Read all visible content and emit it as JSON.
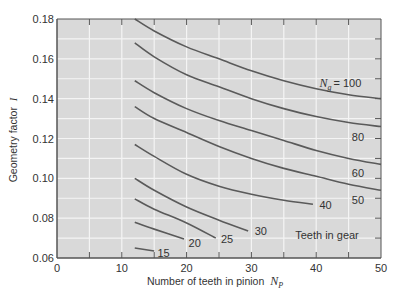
{
  "chart_data": {
    "type": "line",
    "title": "",
    "xlabel": "Number of teeth in pinion",
    "xlabel_sym": "N",
    "xlabel_sub": "P",
    "ylabel": "Geometry factor",
    "ylabel_sym": "I",
    "xlim": [
      0,
      50
    ],
    "ylim": [
      0.06,
      0.18
    ],
    "xticks": [
      0,
      10,
      20,
      30,
      40,
      50
    ],
    "xtick_labels": [
      "0",
      "10",
      "20",
      "30",
      "40",
      "50"
    ],
    "yticks": [
      0.06,
      0.08,
      0.1,
      0.12,
      0.14,
      0.16,
      0.18
    ],
    "ytick_labels": [
      "0.06",
      "0.08",
      "0.10",
      "0.12",
      "0.14",
      "0.16",
      "0.18"
    ],
    "grid": true,
    "grid_x_step": 5,
    "grid_y_step": 0.01,
    "legend_position": "none",
    "annotation": "Teeth in gear",
    "series_label_prefix": "N",
    "series_label_sub": "g",
    "series": [
      {
        "name": "100",
        "label": "= 100",
        "x": [
          12,
          15,
          20,
          25,
          30,
          35,
          40,
          45,
          50
        ],
        "y": [
          0.18,
          0.174,
          0.166,
          0.16,
          0.154,
          0.149,
          0.145,
          0.142,
          0.14
        ],
        "label_pos": [
          40.5,
          0.146
        ]
      },
      {
        "name": "80",
        "x": [
          12,
          15,
          20,
          25,
          30,
          35,
          40,
          45,
          50
        ],
        "y": [
          0.168,
          0.161,
          0.152,
          0.146,
          0.14,
          0.135,
          0.131,
          0.128,
          0.126
        ],
        "label_pos": [
          45.5,
          0.1185
        ]
      },
      {
        "name": "60",
        "x": [
          12,
          15,
          20,
          25,
          30,
          35,
          40,
          45,
          50
        ],
        "y": [
          0.149,
          0.143,
          0.135,
          0.129,
          0.124,
          0.119,
          0.114,
          0.11,
          0.107
        ],
        "label_pos": [
          45.5,
          0.1005
        ]
      },
      {
        "name": "50",
        "x": [
          12,
          15,
          20,
          25,
          30,
          35,
          40,
          45,
          50
        ],
        "y": [
          0.136,
          0.13,
          0.123,
          0.116,
          0.11,
          0.105,
          0.101,
          0.097,
          0.094
        ],
        "label_pos": [
          45.5,
          0.087
        ]
      },
      {
        "name": "40",
        "x": [
          12,
          15,
          20,
          25,
          30,
          35,
          39.5
        ],
        "y": [
          0.117,
          0.111,
          0.102,
          0.096,
          0.092,
          0.089,
          0.087
        ],
        "label_pos": [
          40.5,
          0.0845
        ]
      },
      {
        "name": "30",
        "x": [
          12,
          15,
          20,
          25,
          29.5
        ],
        "y": [
          0.1,
          0.094,
          0.0856,
          0.079,
          0.0736
        ],
        "label_pos": [
          30.5,
          0.0715
        ]
      },
      {
        "name": "25",
        "x": [
          12,
          15,
          20,
          24.5
        ],
        "y": [
          0.0897,
          0.0845,
          0.0776,
          0.07
        ],
        "label_pos": [
          25.3,
          0.0675
        ]
      },
      {
        "name": "20",
        "x": [
          12,
          15,
          19.6
        ],
        "y": [
          0.078,
          0.0745,
          0.0695
        ],
        "label_pos": [
          20.3,
          0.0655
        ]
      },
      {
        "name": "15",
        "x": [
          12,
          15
        ],
        "y": [
          0.065,
          0.0635
        ],
        "label_pos": [
          15.5,
          0.0605
        ]
      }
    ],
    "colors": {
      "plot_bg": "#d9d9d9",
      "grid": "#f4f4f4",
      "axis": "#555555",
      "curve": "#5a5a5a",
      "text": "#333333"
    }
  }
}
